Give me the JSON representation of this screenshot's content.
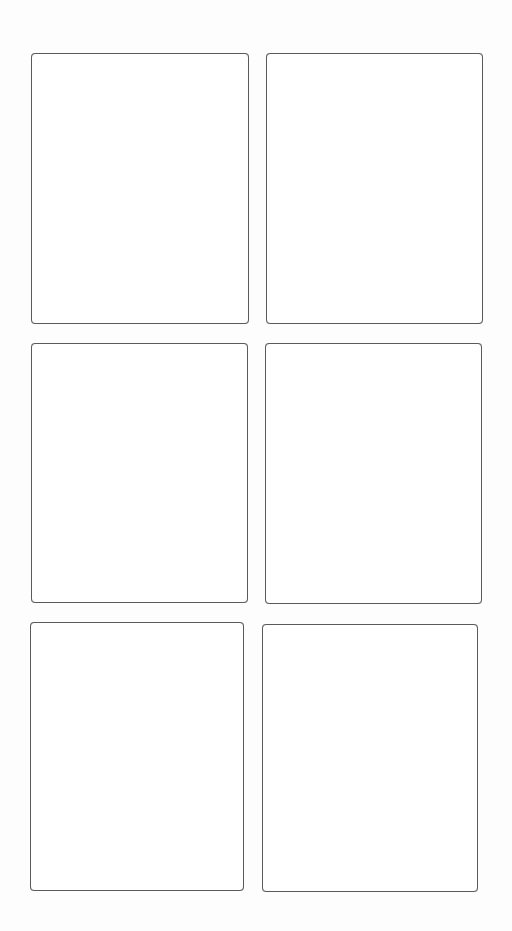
{
  "page": {
    "type": "storyboard-template",
    "layout": {
      "rows": 3,
      "columns": 2
    },
    "border_color": "#5a5a5a",
    "background_color": "#fdfdfd"
  },
  "panels": [
    {
      "row": 1,
      "col": 1,
      "x": 31,
      "y": 53,
      "w": 218,
      "h": 271,
      "content": ""
    },
    {
      "row": 1,
      "col": 2,
      "x": 266,
      "y": 53,
      "w": 217,
      "h": 271,
      "content": ""
    },
    {
      "row": 2,
      "col": 1,
      "x": 31,
      "y": 343,
      "w": 217,
      "h": 260,
      "content": ""
    },
    {
      "row": 2,
      "col": 2,
      "x": 265,
      "y": 343,
      "w": 217,
      "h": 261,
      "content": ""
    },
    {
      "row": 3,
      "col": 1,
      "x": 30,
      "y": 622,
      "w": 214,
      "h": 269,
      "content": ""
    },
    {
      "row": 3,
      "col": 2,
      "x": 262,
      "y": 624,
      "w": 216,
      "h": 268,
      "content": ""
    }
  ]
}
